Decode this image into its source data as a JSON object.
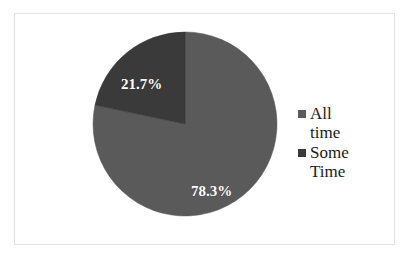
{
  "chart_data": {
    "type": "pie",
    "title": "",
    "categories": [
      "All time",
      "Some Time"
    ],
    "values": [
      78.3,
      21.7
    ],
    "value_labels": [
      "78.3%",
      "21.7%"
    ],
    "units": "percent",
    "legend_position": "right",
    "grid": false,
    "start_angle_deg": 0,
    "direction": "counter-clockwise",
    "colors": {
      "all_time": "#5a5a5a",
      "some_time": "#3a3a3a",
      "label_text": "#ffffff",
      "legend_text": "#1a1a1a",
      "frame_border": "#e3e3e3",
      "background": "#ffffff"
    },
    "slices": [
      {
        "name": "All time",
        "value": 78.3,
        "label": "78.3%",
        "color": "#5a5a5a"
      },
      {
        "name": "Some Time",
        "value": 21.7,
        "label": "21.7%",
        "color": "#3a3a3a"
      }
    ]
  },
  "legend": {
    "entries": [
      {
        "label_line1": "All",
        "label_line2": "time",
        "swatch_color": "#5a5a5a"
      },
      {
        "label_line1": "Some",
        "label_line2": "Time",
        "swatch_color": "#3a3a3a"
      }
    ]
  },
  "labels": {
    "some_time_pct": "21.7%",
    "all_time_pct": "78.3%"
  }
}
